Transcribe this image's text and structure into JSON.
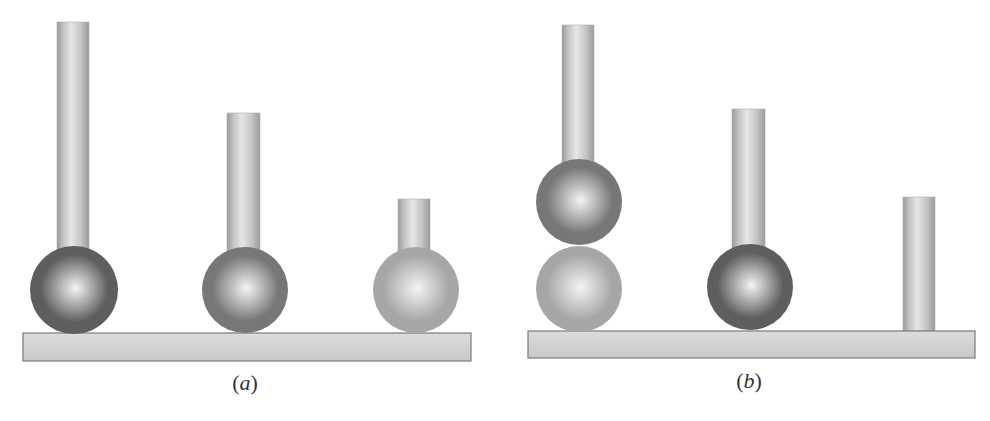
{
  "colors": {
    "background": "#ffffff",
    "rod_light": "#e6e6e6",
    "rod_mid": "#c4c4c4",
    "rod_dark": "#9a9a9a",
    "base_fill": "#d2d2d2",
    "base_stroke": "#7a7a7a",
    "sphere_dark": "#5e5e5e",
    "sphere_medium": "#777777",
    "sphere_light": "#a6a6a6",
    "sphere_highlight": "#f4f4f4"
  },
  "panels": [
    {
      "id": "a",
      "label_open": "(",
      "label_letter": "a",
      "label_close": ")",
      "label_x": 245,
      "label_y": 370,
      "base": {
        "x": 23,
        "y": 333,
        "w": 448,
        "h": 28
      },
      "stations": [
        {
          "rod": {
            "x": 57,
            "y": 22,
            "w": 32,
            "h": 230
          },
          "spheres": [
            {
              "cx": 74,
              "cy": 290,
              "r": 44,
              "shade": "dark"
            }
          ]
        },
        {
          "rod": {
            "x": 227,
            "y": 113,
            "w": 33,
            "h": 139
          },
          "spheres": [
            {
              "cx": 245,
              "cy": 290,
              "r": 43,
              "shade": "medium"
            }
          ]
        },
        {
          "rod": {
            "x": 398,
            "y": 199,
            "w": 32,
            "h": 53
          },
          "spheres": [
            {
              "cx": 416,
              "cy": 290,
              "r": 43,
              "shade": "light"
            }
          ]
        }
      ]
    },
    {
      "id": "b",
      "label_open": "(",
      "label_letter": "b",
      "label_close": ")",
      "label_x": 749,
      "label_y": 368,
      "base": {
        "x": 528,
        "y": 331,
        "w": 447,
        "h": 27
      },
      "stations": [
        {
          "rod": {
            "x": 562,
            "y": 25,
            "w": 32,
            "h": 140
          },
          "spheres": [
            {
              "cx": 579,
              "cy": 289,
              "r": 43,
              "shade": "light"
            },
            {
              "cx": 579,
              "cy": 202,
              "r": 43,
              "shade": "medium"
            }
          ]
        },
        {
          "rod": {
            "x": 732,
            "y": 109,
            "w": 33,
            "h": 140
          },
          "spheres": [
            {
              "cx": 750,
              "cy": 287,
              "r": 43,
              "shade": "dark"
            }
          ]
        },
        {
          "rod": {
            "x": 903,
            "y": 197,
            "w": 32,
            "h": 134
          },
          "spheres": []
        }
      ]
    }
  ]
}
